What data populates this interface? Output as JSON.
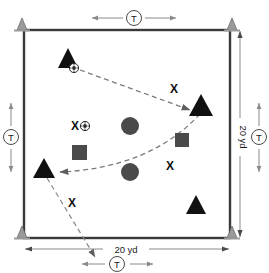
{
  "diagram": {
    "field": {
      "name": "square-grid",
      "border_color": "#3a3a3a",
      "fill_color": "#ffffff"
    },
    "dimensions": {
      "top": {
        "label": "T",
        "style": "circled",
        "name": "top-spacing-dimension"
      },
      "left": {
        "label": "T",
        "style": "circled",
        "name": "left-spacing-dimension"
      },
      "right_outer": {
        "label": "T",
        "style": "circled",
        "name": "right-spacing-dimension"
      },
      "bottom_inner": {
        "label": "T",
        "style": "circled",
        "name": "bottom-spacing-dimension"
      },
      "right_side": {
        "label": "20 yd",
        "name": "field-height-dimension"
      },
      "bottom_side": {
        "label": "20 yd",
        "name": "field-width-dimension"
      }
    },
    "colors": {
      "cone": "#9a9a9a",
      "triangle": "#111111",
      "circle": "#4a4a4a",
      "square": "#4a4a4a",
      "line": "#3a3a3a",
      "dashed": "#6e6e6e",
      "text": "#111111"
    },
    "cones": [
      {
        "name": "cone-top-left",
        "x": 22,
        "y": 28
      },
      {
        "name": "cone-top-right",
        "x": 232,
        "y": 28
      },
      {
        "name": "cone-bottom-left",
        "x": 22,
        "y": 238
      },
      {
        "name": "cone-bottom-right",
        "x": 232,
        "y": 238
      }
    ],
    "triangles": [
      {
        "name": "player-triangle-top-left",
        "x": 68,
        "y": 58,
        "size": 19
      },
      {
        "name": "player-triangle-right",
        "x": 201,
        "y": 106,
        "size": 22
      },
      {
        "name": "player-triangle-bottom-left",
        "x": 44,
        "y": 169,
        "size": 20
      },
      {
        "name": "player-triangle-bottom-right",
        "x": 196,
        "y": 205,
        "size": 19
      }
    ],
    "circles": [
      {
        "name": "player-circle-upper",
        "x": 130,
        "y": 126,
        "r": 9
      },
      {
        "name": "player-circle-lower",
        "x": 130,
        "y": 172,
        "r": 9
      }
    ],
    "squares": [
      {
        "name": "player-square-left",
        "x": 79,
        "y": 152,
        "size": 15
      },
      {
        "name": "player-square-right",
        "x": 182,
        "y": 140,
        "size": 14
      }
    ],
    "balls": [
      {
        "name": "ball-top-left",
        "x": 74,
        "y": 68,
        "r": 4.5
      },
      {
        "name": "ball-center-left",
        "x": 85,
        "y": 126,
        "r": 4.5
      }
    ],
    "x_markers": [
      {
        "name": "x-marker-upper-right",
        "x": 174,
        "y": 89,
        "label": "X"
      },
      {
        "name": "x-marker-center-left",
        "x": 75,
        "y": 127,
        "label": "X"
      },
      {
        "name": "x-marker-lower-right",
        "x": 170,
        "y": 166,
        "label": "X"
      },
      {
        "name": "x-marker-bottom-left",
        "x": 72,
        "y": 203,
        "label": "X"
      }
    ],
    "movement_paths": [
      {
        "name": "pass-path-top-to-right",
        "type": "dashed-arrow"
      },
      {
        "name": "pass-path-right-to-bottom-left",
        "type": "dashed-curve-arrow"
      },
      {
        "name": "run-path-bottom-left-exit",
        "type": "dashed-arrow"
      }
    ]
  }
}
